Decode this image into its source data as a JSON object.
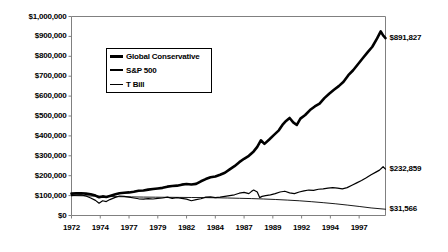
{
  "chart_data": {
    "type": "line",
    "title": "",
    "subtitle": "",
    "xlabel": "",
    "ylabel": "",
    "xlim": [
      1972,
      1998.2
    ],
    "ylim": [
      0,
      1000000
    ],
    "grid": false,
    "legend_position": "top-left-inside",
    "y_ticks": [
      {
        "value": 1000000,
        "label": "$1,000,000"
      },
      {
        "value": 900000,
        "label": "$900,000"
      },
      {
        "value": 800000,
        "label": "$800,000"
      },
      {
        "value": 700000,
        "label": "$700,000"
      },
      {
        "value": 600000,
        "label": "$600,000"
      },
      {
        "value": 500000,
        "label": "$500,000"
      },
      {
        "value": 400000,
        "label": "$400,000"
      },
      {
        "value": 300000,
        "label": "$300,000"
      },
      {
        "value": 200000,
        "label": "$200,000"
      },
      {
        "value": 100000,
        "label": "$100,000"
      },
      {
        "value": 0,
        "label": "$0"
      }
    ],
    "x_ticks": [
      {
        "value": 1972,
        "label": "1972"
      },
      {
        "value": 1974.4,
        "label": "1974"
      },
      {
        "value": 1976.8,
        "label": "1977"
      },
      {
        "value": 1979.2,
        "label": "1979"
      },
      {
        "value": 1981.6,
        "label": "1982"
      },
      {
        "value": 1984.0,
        "label": "1984"
      },
      {
        "value": 1986.4,
        "label": "1987"
      },
      {
        "value": 1988.8,
        "label": "1989"
      },
      {
        "value": 1991.2,
        "label": "1992"
      },
      {
        "value": 1993.6,
        "label": "1994"
      },
      {
        "value": 1996.0,
        "label": "1997"
      }
    ],
    "end_labels": [
      {
        "series": "Global Conservative",
        "label": "$891,827",
        "value": 891827
      },
      {
        "series": "S&P 500",
        "label": "$232,859",
        "value": 232859
      },
      {
        "series": "T Bill",
        "label": "$31,566",
        "value": 31566
      }
    ],
    "series": [
      {
        "name": "Global Conservative",
        "color": "#000000",
        "width": 2.6,
        "x": [
          1972.0,
          1972.4,
          1972.8,
          1973.2,
          1973.6,
          1974.0,
          1974.3,
          1974.6,
          1974.9,
          1975.2,
          1975.6,
          1976.0,
          1976.4,
          1976.8,
          1977.2,
          1977.6,
          1978.0,
          1978.4,
          1978.8,
          1979.2,
          1979.6,
          1980.0,
          1980.4,
          1980.8,
          1981.2,
          1981.6,
          1982.0,
          1982.4,
          1982.8,
          1983.2,
          1983.6,
          1984.0,
          1984.4,
          1984.8,
          1985.2,
          1985.6,
          1986.0,
          1986.4,
          1986.8,
          1987.2,
          1987.5,
          1987.8,
          1988.1,
          1988.5,
          1988.9,
          1989.3,
          1989.6,
          1989.9,
          1990.2,
          1990.5,
          1990.8,
          1991.1,
          1991.5,
          1991.9,
          1992.3,
          1992.7,
          1993.1,
          1993.5,
          1993.9,
          1994.3,
          1994.7,
          1995.1,
          1995.5,
          1995.9,
          1996.3,
          1996.7,
          1997.1,
          1997.5,
          1997.8,
          1998.0,
          1998.2
        ],
        "y": [
          110000,
          111000,
          112000,
          110000,
          107000,
          100000,
          92000,
          96000,
          93000,
          98000,
          105000,
          112000,
          114000,
          116000,
          119000,
          124000,
          126000,
          130000,
          133000,
          136000,
          139000,
          145000,
          148000,
          150000,
          155000,
          158000,
          156000,
          159000,
          172000,
          183000,
          192000,
          196000,
          205000,
          215000,
          232000,
          248000,
          268000,
          285000,
          300000,
          322000,
          345000,
          378000,
          360000,
          382000,
          405000,
          428000,
          455000,
          475000,
          490000,
          468000,
          455000,
          487000,
          505000,
          530000,
          548000,
          562000,
          590000,
          612000,
          632000,
          650000,
          672000,
          705000,
          730000,
          760000,
          790000,
          820000,
          848000,
          890000,
          925000,
          905000,
          891827
        ]
      },
      {
        "name": "S&P 500",
        "color": "#000000",
        "width": 1.2,
        "x": [
          1972.0,
          1972.4,
          1972.8,
          1973.2,
          1973.6,
          1974.0,
          1974.3,
          1974.6,
          1974.9,
          1975.2,
          1975.6,
          1976.0,
          1976.4,
          1976.8,
          1977.2,
          1977.6,
          1978.0,
          1978.4,
          1978.8,
          1979.2,
          1979.6,
          1980.0,
          1980.4,
          1980.8,
          1981.2,
          1981.6,
          1982.0,
          1982.4,
          1982.8,
          1983.2,
          1983.6,
          1984.0,
          1984.4,
          1984.8,
          1985.2,
          1985.6,
          1986.0,
          1986.4,
          1986.8,
          1987.0,
          1987.2,
          1987.5,
          1987.7,
          1987.9,
          1988.2,
          1988.6,
          1989.0,
          1989.4,
          1989.8,
          1990.2,
          1990.6,
          1991.0,
          1991.4,
          1991.8,
          1992.2,
          1992.6,
          1993.0,
          1993.4,
          1993.8,
          1994.2,
          1994.6,
          1995.0,
          1995.4,
          1995.8,
          1996.2,
          1996.6,
          1997.0,
          1997.4,
          1997.7,
          1998.0,
          1998.2
        ],
        "y": [
          100000,
          102000,
          104000,
          98000,
          88000,
          76000,
          62000,
          74000,
          70000,
          80000,
          90000,
          98000,
          96000,
          92000,
          88000,
          84000,
          82000,
          85000,
          83000,
          86000,
          88000,
          92000,
          86000,
          90000,
          86000,
          82000,
          74000,
          80000,
          84000,
          92000,
          94000,
          90000,
          92000,
          96000,
          100000,
          104000,
          112000,
          116000,
          110000,
          120000,
          128000,
          118000,
          90000,
          96000,
          100000,
          104000,
          110000,
          118000,
          122000,
          114000,
          110000,
          118000,
          124000,
          128000,
          126000,
          132000,
          134000,
          138000,
          140000,
          138000,
          134000,
          140000,
          152000,
          164000,
          176000,
          190000,
          205000,
          218000,
          228000,
          245000,
          232859
        ]
      },
      {
        "name": "T Bill",
        "color": "#000000",
        "width": 0.9,
        "x": [
          1972.0,
          1973.0,
          1974.0,
          1975.0,
          1976.0,
          1977.0,
          1978.0,
          1979.0,
          1980.0,
          1981.0,
          1982.0,
          1983.0,
          1984.0,
          1985.0,
          1986.0,
          1987.0,
          1988.0,
          1989.0,
          1990.0,
          1991.0,
          1992.0,
          1993.0,
          1994.0,
          1995.0,
          1996.0,
          1997.0,
          1998.2
        ],
        "y": [
          100000,
          99000,
          97500,
          95500,
          94500,
          93500,
          92500,
          92000,
          91500,
          91000,
          90500,
          90000,
          89000,
          88000,
          86500,
          85000,
          83000,
          80500,
          77500,
          74000,
          69500,
          64500,
          59000,
          52500,
          45500,
          38000,
          31566
        ]
      }
    ]
  },
  "legend": {
    "items": [
      {
        "label": "Global Conservative",
        "style": "thick"
      },
      {
        "label": "S&P 500",
        "style": "medium"
      },
      {
        "label": "T Bill",
        "style": "thin"
      }
    ]
  },
  "colors": {
    "axis": "#808080",
    "line": "#000000",
    "background": "#ffffff"
  }
}
